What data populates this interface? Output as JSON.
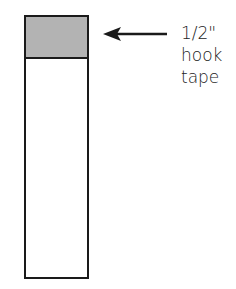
{
  "diagram": {
    "label_lines": [
      "1/2\"",
      "hook",
      "tape"
    ],
    "colors": {
      "outline": "#1a1a1a",
      "hook_fill": "#b3b3b3",
      "background": "#ffffff"
    }
  }
}
